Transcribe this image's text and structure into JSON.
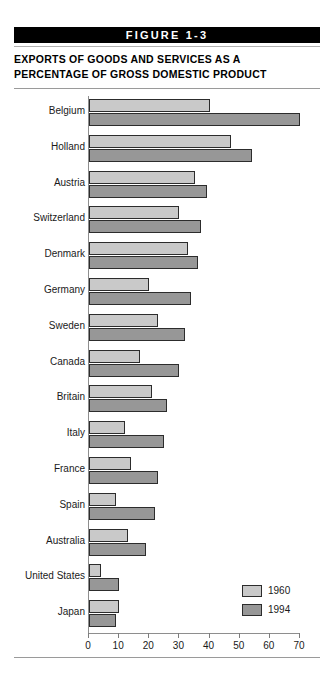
{
  "banner": {
    "label": "FIGURE 1-3"
  },
  "title": {
    "line1": "EXPORTS OF GOODS AND SERVICES AS A",
    "line2": "PERCENTAGE OF GROSS DOMESTIC PRODUCT"
  },
  "legend": {
    "items": [
      {
        "label": "1960",
        "color": "#c9c9c9"
      },
      {
        "label": "1994",
        "color": "#979797"
      }
    ]
  },
  "chart_data": {
    "type": "bar",
    "orientation": "horizontal",
    "title": "EXPORTS OF GOODS AND SERVICES AS A PERCENTAGE OF GROSS DOMESTIC PRODUCT",
    "figure_label": "FIGURE 1-3",
    "xlabel": "",
    "ylabel": "",
    "xlim": [
      0,
      70
    ],
    "xticks": [
      0,
      10,
      20,
      30,
      40,
      50,
      60,
      70
    ],
    "xtick_labels": [
      "0",
      "10",
      "20",
      "30",
      "40",
      "50",
      "60",
      "70"
    ],
    "grid": false,
    "legend_position": "bottom-right",
    "categories": [
      "Belgium",
      "Holland",
      "Austria",
      "Switzerland",
      "Denmark",
      "Germany",
      "Sweden",
      "Canada",
      "Britain",
      "Italy",
      "France",
      "Spain",
      "Australia",
      "United States",
      "Japan"
    ],
    "series": [
      {
        "name": "1960",
        "color": "#c9c9c9",
        "values": [
          40,
          47,
          35,
          30,
          33,
          20,
          23,
          17,
          21,
          12,
          14,
          9,
          13,
          4,
          10
        ]
      },
      {
        "name": "1994",
        "color": "#979797",
        "values": [
          70,
          54,
          39,
          37,
          36,
          34,
          32,
          30,
          26,
          25,
          23,
          22,
          19,
          10,
          9
        ]
      }
    ]
  }
}
